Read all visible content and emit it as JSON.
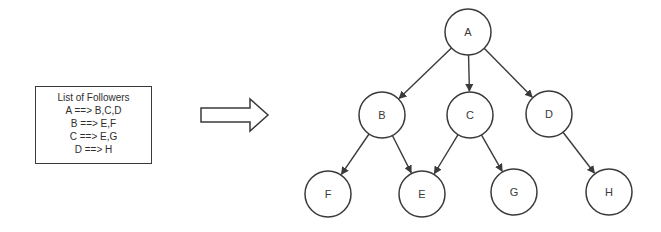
{
  "followers_list": {
    "title": "List of Followers",
    "entries": [
      {
        "source": "A",
        "text": "A ==> B,C,D"
      },
      {
        "source": "B",
        "text": "B ==> E,F"
      },
      {
        "source": "C",
        "text": "C ==> E,G"
      },
      {
        "source": "D",
        "text": "D ==> H"
      }
    ]
  },
  "transform_arrow": {
    "icon": "block-arrow-right-icon"
  },
  "graph": {
    "stroke_color": "#3a3a3a",
    "background": "#ffffff",
    "nodes": [
      {
        "id": "A",
        "label": "A",
        "cx": 468,
        "cy": 32
      },
      {
        "id": "B",
        "label": "B",
        "cx": 382,
        "cy": 115
      },
      {
        "id": "C",
        "label": "C",
        "cx": 470,
        "cy": 115
      },
      {
        "id": "D",
        "label": "D",
        "cx": 549,
        "cy": 114
      },
      {
        "id": "F",
        "label": "F",
        "cx": 328,
        "cy": 194
      },
      {
        "id": "E",
        "label": "E",
        "cx": 422,
        "cy": 194
      },
      {
        "id": "G",
        "label": "G",
        "cx": 514,
        "cy": 192
      },
      {
        "id": "H",
        "label": "H",
        "cx": 609,
        "cy": 192
      }
    ],
    "edges": [
      {
        "from": "A",
        "to": "B"
      },
      {
        "from": "A",
        "to": "C"
      },
      {
        "from": "A",
        "to": "D"
      },
      {
        "from": "B",
        "to": "F"
      },
      {
        "from": "B",
        "to": "E"
      },
      {
        "from": "C",
        "to": "E"
      },
      {
        "from": "C",
        "to": "G"
      },
      {
        "from": "D",
        "to": "H"
      }
    ]
  }
}
